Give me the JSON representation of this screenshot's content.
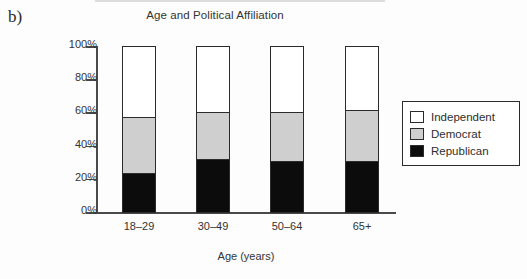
{
  "panel_letter": "b)",
  "chart_data": {
    "type": "bar",
    "subtype": "stacked-percentage",
    "title": "Age and Political Affiliation",
    "xlabel": "Age (years)",
    "ylabel": "",
    "categories": [
      "18–29",
      "30–49",
      "50–64",
      "65+"
    ],
    "ytick_labels": [
      "0%",
      "20%",
      "40%",
      "60%",
      "80%",
      "100%"
    ],
    "ytick_values": [
      0,
      20,
      40,
      60,
      80,
      100
    ],
    "ylim": [
      0,
      100
    ],
    "grid": false,
    "legend_position": "right",
    "series": [
      {
        "name": "Republican",
        "color": "#0c0c0c",
        "values": [
          23,
          31,
          30,
          30
        ]
      },
      {
        "name": "Democrat",
        "color": "#cfcfcf",
        "values": [
          34,
          29,
          30,
          31
        ]
      },
      {
        "name": "Independent",
        "color": "#ffffff",
        "values": [
          43,
          40,
          40,
          39
        ]
      }
    ],
    "cumulative_tops": {
      "Republican": [
        23,
        31,
        30,
        30
      ],
      "Democrat": [
        57,
        60,
        60,
        61
      ],
      "Independent": [
        100,
        100,
        100,
        100
      ]
    },
    "legend_entries": [
      "Independent",
      "Democrat",
      "Republican"
    ]
  }
}
